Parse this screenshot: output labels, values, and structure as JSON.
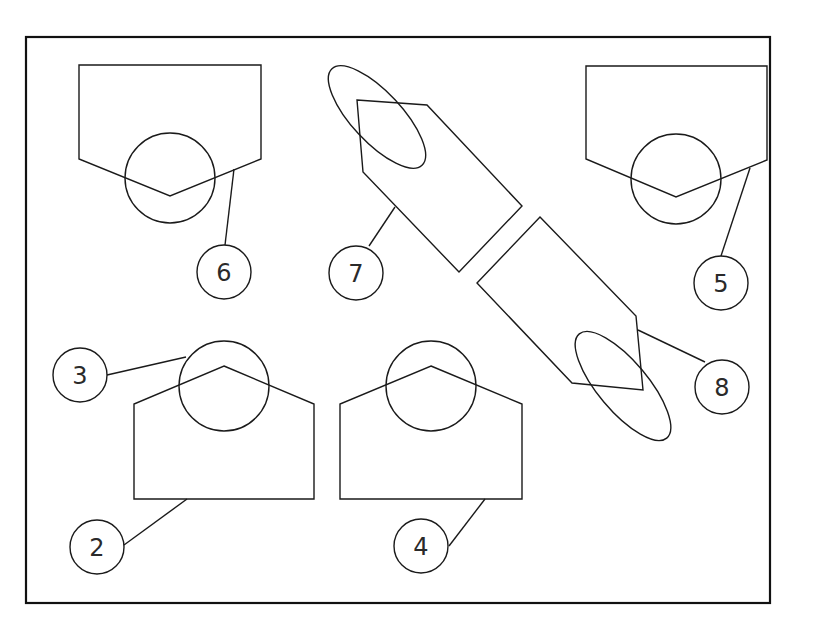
{
  "diagram": {
    "type": "technical-callout-drawing",
    "colors": {
      "stroke": "#1a1a1a",
      "background": "#ffffff"
    },
    "frame": {
      "x": 26,
      "y": 37,
      "width": 744,
      "height": 566
    },
    "parts": [
      {
        "id": "part-6",
        "label": "6",
        "shape": "pentagon-pointing-down",
        "points": "79,65 261,65 261,159 170,196 79,159",
        "circle": {
          "cx": 170,
          "cy": 178,
          "r": 45
        },
        "leader": {
          "x1": 234,
          "y1": 169,
          "x2": 225,
          "y2": 245
        },
        "callout": {
          "cx": 224,
          "cy": 272,
          "r": 27
        }
      },
      {
        "id": "part-5",
        "label": "5",
        "shape": "pentagon-pointing-down",
        "points": "586,66 767,66 767,160 676,197 586,159",
        "circle": {
          "cx": 676,
          "cy": 179,
          "r": 45
        },
        "leader": {
          "x1": 750,
          "y1": 168,
          "x2": 721,
          "y2": 256
        },
        "callout": {
          "cx": 721,
          "cy": 283,
          "r": 27
        }
      },
      {
        "id": "part-2-3",
        "label": "2",
        "label_top": "3",
        "shape": "pentagon-pointing-up",
        "points": "224,366 314,404 314,499 134,499 134,404",
        "circle": {
          "cx": 224,
          "cy": 386,
          "r": 45
        },
        "leader": {
          "x1": 187,
          "y1": 499,
          "x2": 124,
          "y2": 545
        },
        "callout": {
          "cx": 97,
          "cy": 547,
          "r": 27
        },
        "leader_top": {
          "x1": 107,
          "y1": 375,
          "x2": 186,
          "y2": 357
        },
        "callout_top": {
          "cx": 80,
          "cy": 375,
          "r": 27
        }
      },
      {
        "id": "part-4",
        "label": "4",
        "shape": "pentagon-pointing-up",
        "points": "431,366 522,404 522,499 340,499 340,404",
        "circle": {
          "cx": 431,
          "cy": 386,
          "r": 45
        },
        "leader": {
          "x1": 485,
          "y1": 499,
          "x2": 449,
          "y2": 546
        },
        "callout": {
          "cx": 421,
          "cy": 546,
          "r": 27
        }
      },
      {
        "id": "part-7",
        "label": "7",
        "shape": "tilted-pentagon",
        "points": "357,100 427,105 522,206 459,272 363,172",
        "ellipse": {
          "cx": 377,
          "cy": 117,
          "rx": 66,
          "ry": 25,
          "rotate": 47
        },
        "leader": {
          "x1": 395,
          "y1": 207,
          "x2": 369,
          "y2": 246
        },
        "callout": {
          "cx": 356,
          "cy": 273,
          "r": 27
        }
      },
      {
        "id": "part-8",
        "label": "8",
        "shape": "tilted-pentagon",
        "points": "540,217 636,316 643,390 572,383 477,283",
        "ellipse": {
          "cx": 623,
          "cy": 386,
          "rx": 68,
          "ry": 25,
          "rotate": 50
        },
        "leader": {
          "x1": 638,
          "y1": 330,
          "x2": 705,
          "y2": 362
        },
        "callout": {
          "cx": 722,
          "cy": 387,
          "r": 27
        }
      }
    ]
  }
}
